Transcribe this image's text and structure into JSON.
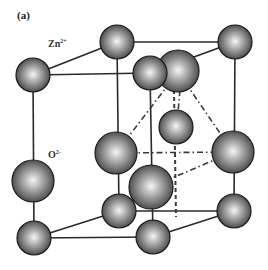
{
  "figure": {
    "panel_label": "(a)",
    "labels": {
      "zn": {
        "base": "Zn",
        "sup": "2+"
      },
      "o": {
        "base": "O",
        "sup": "2-"
      }
    },
    "colors": {
      "sphere_highlight": "#f4f4f4",
      "sphere_mid": "#8a8a8a",
      "sphere_shadow": "#3a3a3a",
      "line": "#2a2a2a",
      "background": "#ffffff"
    },
    "structure": "zinc blende unit cell",
    "atoms_visible": 14
  }
}
